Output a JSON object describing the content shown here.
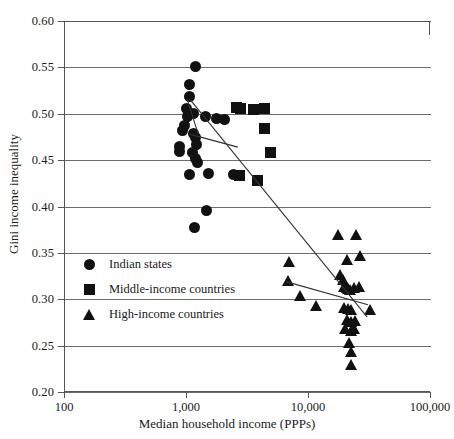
{
  "chart_data": {
    "type": "scatter",
    "title": "",
    "xlabel": "Median household income (PPPs)",
    "ylabel": "Gini income inequality",
    "xscale": "log",
    "xlim": [
      100,
      100000
    ],
    "ylim": [
      0.2,
      0.6
    ],
    "x_ticks": [
      {
        "value": 100,
        "label": "100"
      },
      {
        "value": 1000,
        "label": "1,000"
      },
      {
        "value": 10000,
        "label": "10,000"
      },
      {
        "value": 100000,
        "label": "100,000"
      }
    ],
    "y_ticks": [
      {
        "value": 0.6,
        "label": "0.60"
      },
      {
        "value": 0.55,
        "label": "0.55"
      },
      {
        "value": 0.5,
        "label": "0.50"
      },
      {
        "value": 0.45,
        "label": "0.45"
      },
      {
        "value": 0.4,
        "label": "0.40"
      },
      {
        "value": 0.35,
        "label": "0.35"
      },
      {
        "value": 0.3,
        "label": "0.30"
      },
      {
        "value": 0.25,
        "label": "0.25"
      },
      {
        "value": 0.2,
        "label": "0.20"
      }
    ],
    "grid": true,
    "legend_position": "inner-left",
    "marker_color": "#111111",
    "gridline_color": "#6b6b6b",
    "axis_color": "#555555",
    "series": [
      {
        "name": "Indian states",
        "marker": "circle",
        "points": [
          [
            1180,
            0.551
          ],
          [
            1050,
            0.531
          ],
          [
            1050,
            0.519
          ],
          [
            990,
            0.506
          ],
          [
            1010,
            0.497
          ],
          [
            1140,
            0.5
          ],
          [
            1430,
            0.497
          ],
          [
            1760,
            0.495
          ],
          [
            2020,
            0.494
          ],
          [
            960,
            0.487
          ],
          [
            925,
            0.482
          ],
          [
            1120,
            0.479
          ],
          [
            1180,
            0.474
          ],
          [
            1200,
            0.467
          ],
          [
            870,
            0.465
          ],
          [
            860,
            0.459
          ],
          [
            1110,
            0.458
          ],
          [
            1180,
            0.452
          ],
          [
            1230,
            0.447
          ],
          [
            1040,
            0.434
          ],
          [
            1500,
            0.436
          ],
          [
            2420,
            0.434
          ],
          [
            1450,
            0.396
          ],
          [
            1150,
            0.377
          ]
        ]
      },
      {
        "name": "Middle-income countries",
        "marker": "square",
        "points": [
          [
            2550,
            0.507
          ],
          [
            2760,
            0.506
          ],
          [
            3500,
            0.505
          ],
          [
            4300,
            0.506
          ],
          [
            4350,
            0.484
          ],
          [
            4850,
            0.458
          ],
          [
            2700,
            0.433
          ],
          [
            3800,
            0.428
          ]
        ]
      },
      {
        "name": "High-income countries",
        "marker": "triangle",
        "points": [
          [
            17500,
            0.369
          ],
          [
            24500,
            0.369
          ],
          [
            6900,
            0.34
          ],
          [
            20500,
            0.342
          ],
          [
            26500,
            0.347
          ],
          [
            6800,
            0.32
          ],
          [
            18200,
            0.326
          ],
          [
            19000,
            0.321
          ],
          [
            19500,
            0.313
          ],
          [
            20500,
            0.312
          ],
          [
            21200,
            0.311
          ],
          [
            22000,
            0.31
          ],
          [
            23500,
            0.312
          ],
          [
            26000,
            0.313
          ],
          [
            8500,
            0.303
          ],
          [
            11500,
            0.293
          ],
          [
            19500,
            0.291
          ],
          [
            21000,
            0.29
          ],
          [
            22500,
            0.288
          ],
          [
            20500,
            0.278
          ],
          [
            22500,
            0.276
          ],
          [
            24000,
            0.277
          ],
          [
            32000,
            0.288
          ],
          [
            20000,
            0.268
          ],
          [
            22500,
            0.266
          ],
          [
            23500,
            0.268
          ],
          [
            21500,
            0.253
          ],
          [
            22500,
            0.243
          ],
          [
            22500,
            0.229
          ]
        ]
      }
    ],
    "trend_lines": [
      {
        "name": "indian-states-steep-fit",
        "x1": 1020,
        "y1": 0.516,
        "x2": 1260,
        "y2": 0.478
      },
      {
        "name": "indian-states-shallow-fit",
        "x1": 1070,
        "y1": 0.478,
        "x2": 2660,
        "y2": 0.464
      },
      {
        "name": "pooled-overall-fit",
        "x1": 1070,
        "y1": 0.516,
        "x2": 30500,
        "y2": 0.281
      },
      {
        "name": "high-income-fit",
        "x1": 6600,
        "y1": 0.319,
        "x2": 31000,
        "y2": 0.294
      }
    ]
  },
  "legend": {
    "items": [
      {
        "label": "Indian states",
        "marker": "circle"
      },
      {
        "label": "Middle-income countries",
        "marker": "square"
      },
      {
        "label": "High-income countries",
        "marker": "triangle"
      }
    ]
  }
}
